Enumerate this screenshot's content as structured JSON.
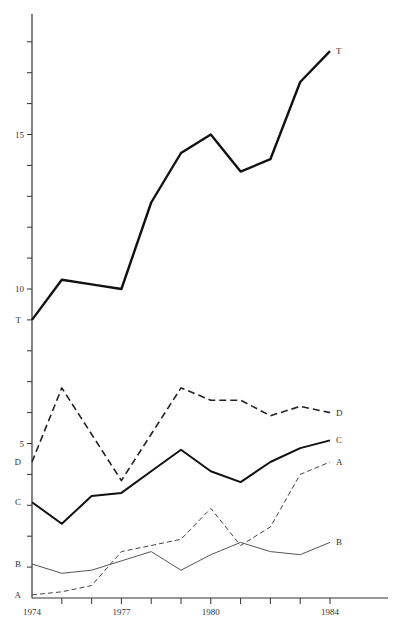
{
  "chart_data": {
    "type": "line",
    "title": "",
    "xlabel": "",
    "ylabel": "",
    "x": [
      1974,
      1975,
      1976,
      1977,
      1978,
      1979,
      1980,
      1981,
      1982,
      1983,
      1984
    ],
    "x_tick_labels": [
      "1974",
      "1977",
      "1980",
      "1984"
    ],
    "y_tick_labels": [
      "5",
      "10",
      "15"
    ],
    "xlim": [
      1974,
      1986
    ],
    "ylim": [
      0,
      18.9
    ],
    "grid": false,
    "legend": "inline end labels",
    "series": [
      {
        "name": "T",
        "style": "solid-thick",
        "color": "#111111",
        "values": [
          9.0,
          10.3,
          10.15,
          10.0,
          12.8,
          14.4,
          15.0,
          13.8,
          14.2,
          16.7,
          17.7
        ]
      },
      {
        "name": "D",
        "style": "dashed-thick",
        "color": "#222222",
        "values": [
          4.4,
          6.8,
          5.3,
          3.8,
          5.3,
          6.8,
          6.4,
          6.4,
          5.9,
          6.2,
          6.0
        ]
      },
      {
        "name": "C",
        "style": "solid-medium",
        "color": "#111111",
        "values": [
          3.1,
          2.4,
          3.3,
          3.4,
          4.1,
          4.8,
          4.1,
          3.75,
          4.4,
          4.85,
          5.1
        ]
      },
      {
        "name": "A",
        "style": "dashed-thin",
        "color": "#444444",
        "values": [
          0.1,
          0.2,
          0.4,
          1.5,
          1.7,
          1.9,
          2.9,
          1.7,
          2.3,
          4.0,
          4.4
        ]
      },
      {
        "name": "B",
        "style": "solid-thin",
        "color": "#555555",
        "values": [
          1.1,
          0.8,
          0.9,
          1.2,
          1.5,
          0.9,
          1.4,
          1.8,
          1.5,
          1.4,
          1.8
        ]
      }
    ]
  }
}
